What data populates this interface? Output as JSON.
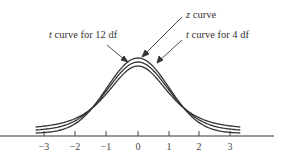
{
  "chart_data": {
    "type": "line",
    "title": "",
    "xlabel": "",
    "ylabel": "",
    "x_ticks": [
      -3,
      -2,
      -1,
      0,
      1,
      2,
      3
    ],
    "x_tick_labels": [
      "−3",
      "−2",
      "−1",
      "0",
      "1",
      "2",
      "3"
    ],
    "xlim": [
      -3.3,
      3.3
    ],
    "grid": false,
    "legend": "none (curves identified by arrow annotations)",
    "series": [
      {
        "name": "z curve",
        "distribution": "standard normal",
        "df": null,
        "peak_density": 0.399
      },
      {
        "name": "t curve for 12 df",
        "distribution": "Student t",
        "df": 12,
        "peak_density": 0.391
      },
      {
        "name": "t curve for 4 df",
        "distribution": "Student t",
        "df": 4,
        "peak_density": 0.375
      }
    ],
    "annotations": [
      {
        "text": "z curve",
        "italic_prefix": "z",
        "points_to": "z curve"
      },
      {
        "text": "t curve for 12 df",
        "italic_prefix": "t",
        "points_to": "t curve for 12 df"
      },
      {
        "text": "t curve for 4 df",
        "italic_prefix": "t",
        "points_to": "t curve for 4 df"
      }
    ]
  },
  "labels": {
    "z_italic": "z",
    "z_rest": " curve",
    "t12_italic": "t",
    "t12_rest": " curve for 12 df",
    "t4_italic": "t",
    "t4_rest": " curve for 4 df"
  },
  "ticks": [
    "−3",
    "−2",
    "−1",
    "0",
    "1",
    "2",
    "3"
  ],
  "colors": {
    "curve": "#333333",
    "axis": "#333333",
    "background": "#ffffff"
  }
}
